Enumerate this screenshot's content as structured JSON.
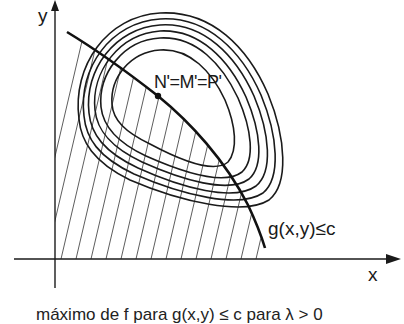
{
  "diagram": {
    "type": "constrained-optimization-level-curves",
    "axes": {
      "x_label": "x",
      "y_label": "y"
    },
    "point": {
      "label": "N'=M'=P'",
      "description": "maximum point on constraint boundary"
    },
    "constraint": {
      "label": "g(x,y)≤c",
      "region": "hatched feasible region below constraint curve"
    },
    "level_curves": {
      "count": 6,
      "description": "nested closed contour curves of f"
    },
    "caption": "máximo de f para g(x,y) ≤ c para λ > 0"
  },
  "colors": {
    "ink": "#1a1a1a",
    "hatch": "#333333",
    "background": "#ffffff"
  }
}
